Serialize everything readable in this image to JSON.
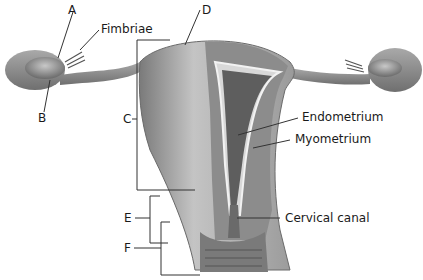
{
  "diagram": {
    "type": "anatomical-illustration",
    "labels": {
      "a": "A",
      "b": "B",
      "c": "C",
      "d": "D",
      "e": "E",
      "f": "F",
      "fimbriae": "Fimbriae",
      "endometrium": "Endometrium",
      "myometrium": "Myometrium",
      "cervical_canal": "Cervical canal"
    },
    "colors": {
      "tissue_light": "#b8b8b8",
      "tissue_mid": "#8f8f8f",
      "tissue_dark": "#5e5e5e",
      "leader_line": "#333333",
      "text": "#1a1a1a"
    }
  }
}
